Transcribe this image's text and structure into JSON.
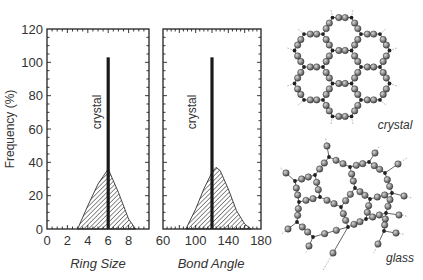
{
  "figure": {
    "y_axis_title": "Frequency (%)",
    "crystal_annotation": "crystal",
    "structure_labels": {
      "crystal": "crystal",
      "glass": "glass"
    }
  },
  "chart_data": [
    {
      "type": "area",
      "title": "",
      "xlabel": "Ring Size",
      "ylabel": "Frequency (%)",
      "xlim": [
        0,
        10
      ],
      "ylim": [
        0,
        120
      ],
      "x_ticks": [
        "0",
        "2",
        "4",
        "6",
        "8"
      ],
      "y_ticks": [
        "0",
        "20",
        "40",
        "60",
        "80",
        "100",
        "120"
      ],
      "grid": false,
      "series": [
        {
          "name": "glass",
          "style": "hatched area",
          "x": [
            3,
            4,
            5,
            6,
            7,
            8,
            8.7
          ],
          "y": [
            0,
            14,
            27,
            36,
            22,
            6,
            0
          ]
        },
        {
          "name": "crystal",
          "style": "vertical line",
          "x": [
            6
          ],
          "y": [
            103
          ]
        }
      ],
      "annotations": [
        "crystal"
      ]
    },
    {
      "type": "area",
      "title": "",
      "xlabel": "Bond Angle",
      "ylabel": "",
      "xlim": [
        60,
        180
      ],
      "ylim": [
        0,
        120
      ],
      "x_ticks": [
        "60",
        "100",
        "140",
        "180"
      ],
      "grid": false,
      "series": [
        {
          "name": "glass",
          "style": "hatched area",
          "x": [
            88,
            100,
            110,
            120,
            125,
            130,
            140,
            150,
            160,
            168
          ],
          "y": [
            0,
            12,
            24,
            34,
            37,
            35,
            24,
            11,
            3,
            0
          ]
        },
        {
          "name": "crystal",
          "style": "vertical line",
          "x": [
            120
          ],
          "y": [
            103
          ]
        }
      ],
      "annotations": [
        "crystal"
      ]
    }
  ]
}
